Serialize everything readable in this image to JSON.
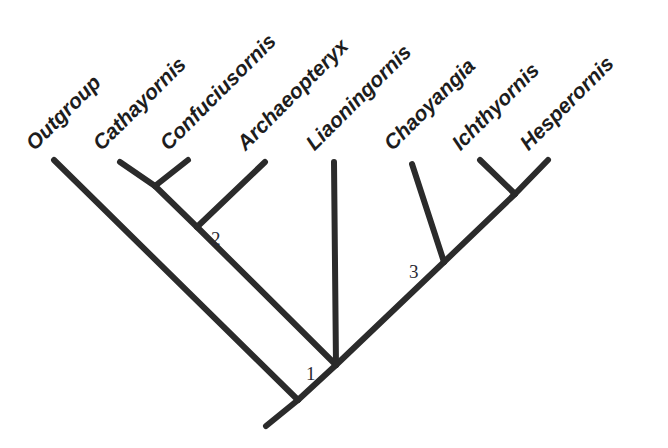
{
  "figure": {
    "type": "cladogram",
    "width": 668,
    "height": 448,
    "background_color": "#ffffff",
    "branch_color": "#2b2b2b",
    "branch_width": 6,
    "label_color": "#1d1d1d",
    "node_label_color": "#2a2a33",
    "label_rotation_degrees": -45
  },
  "taxa": [
    {
      "id": "outgroup",
      "label": "Outgroup",
      "label_x": 38,
      "label_y": 152,
      "tip_x": 54,
      "tip_y": 160
    },
    {
      "id": "cathayornis",
      "label": "Cathayornis",
      "label_x": 105,
      "label_y": 152,
      "tip_x": 120,
      "tip_y": 162
    },
    {
      "id": "confuciusornis",
      "label": "Confuciusornis",
      "label_x": 172,
      "label_y": 152,
      "tip_x": 188,
      "tip_y": 160
    },
    {
      "id": "archaeopteryx",
      "label": "Archaeopteryx",
      "label_x": 249,
      "label_y": 152,
      "tip_x": 265,
      "tip_y": 162
    },
    {
      "id": "liaoningornis",
      "label": "Liaoningornis",
      "label_x": 318,
      "label_y": 152,
      "tip_x": 334,
      "tip_y": 162
    },
    {
      "id": "chaoyangia",
      "label": "Chaoyangia",
      "label_x": 396,
      "label_y": 152,
      "tip_x": 412,
      "tip_y": 164
    },
    {
      "id": "ichthyornis",
      "label": "Ichthyornis",
      "label_x": 464,
      "label_y": 152,
      "tip_x": 480,
      "tip_y": 160
    },
    {
      "id": "hesperornis",
      "label": "Hesperornis",
      "label_x": 532,
      "label_y": 152,
      "tip_x": 548,
      "tip_y": 160
    }
  ],
  "node_labels": [
    {
      "id": "node-1",
      "label": "1",
      "x": 306,
      "y": 363
    },
    {
      "id": "node-2",
      "label": "2",
      "x": 211,
      "y": 228
    },
    {
      "id": "node-3",
      "label": "3",
      "x": 409,
      "y": 261
    }
  ],
  "chart_data": {
    "type": "tree",
    "title": "",
    "orientation": "diagonal-45",
    "tips": [
      "Outgroup",
      "Cathayornis",
      "Confuciusornis",
      "Archaeopteryx",
      "Liaoningornis",
      "Chaoyangia",
      "Ichthyornis",
      "Hesperornis"
    ],
    "internal_nodes": [
      {
        "name": "1",
        "children": [
          "node-2-clade",
          "node-liaoningornis-clade"
        ]
      },
      {
        "name": "2",
        "children": [
          "cathayornis-confuciusornis",
          "Archaeopteryx"
        ]
      },
      {
        "name": "3",
        "children": [
          "Chaoyangia",
          "ichthyornis-hesperornis"
        ]
      }
    ],
    "newick": "(Outgroup,((Cathayornis,Confuciusornis)2,Archaeopteryx),(Liaoningornis,(Chaoyangia,(Ichthyornis,Hesperornis))3)1);",
    "edges": [
      {
        "from": "root",
        "to": "outgroup-tip",
        "x1": 298,
        "y1": 400,
        "x2": 54,
        "y2": 160
      },
      {
        "from": "root",
        "to": "root-stem",
        "x1": 298,
        "y1": 400,
        "x2": 266,
        "y2": 426
      },
      {
        "from": "root",
        "to": "node-1",
        "x1": 298,
        "y1": 400,
        "x2": 336,
        "y2": 365
      },
      {
        "from": "node-1",
        "to": "node-2",
        "x1": 336,
        "y1": 365,
        "x2": 197,
        "y2": 227
      },
      {
        "from": "node-2",
        "to": "node-2a",
        "x1": 197,
        "y1": 227,
        "x2": 155,
        "y2": 186
      },
      {
        "from": "node-2a",
        "to": "cathayornis",
        "x1": 155,
        "y1": 186,
        "x2": 120,
        "y2": 162
      },
      {
        "from": "node-2a",
        "to": "confuciusornis",
        "x1": 155,
        "y1": 186,
        "x2": 188,
        "y2": 160
      },
      {
        "from": "node-2",
        "to": "archaeopteryx",
        "x1": 197,
        "y1": 227,
        "x2": 265,
        "y2": 162
      },
      {
        "from": "node-1",
        "to": "liaoningornis",
        "x1": 336,
        "y1": 365,
        "x2": 334,
        "y2": 162
      },
      {
        "from": "node-1",
        "to": "node-3",
        "x1": 336,
        "y1": 365,
        "x2": 444,
        "y2": 262
      },
      {
        "from": "node-3",
        "to": "chaoyangia",
        "x1": 444,
        "y1": 262,
        "x2": 412,
        "y2": 164
      },
      {
        "from": "node-3",
        "to": "node-3a",
        "x1": 444,
        "y1": 262,
        "x2": 515,
        "y2": 194
      },
      {
        "from": "node-3a",
        "to": "ichthyornis",
        "x1": 515,
        "y1": 194,
        "x2": 480,
        "y2": 160
      },
      {
        "from": "node-3a",
        "to": "hesperornis",
        "x1": 515,
        "y1": 194,
        "x2": 548,
        "y2": 160
      }
    ]
  }
}
